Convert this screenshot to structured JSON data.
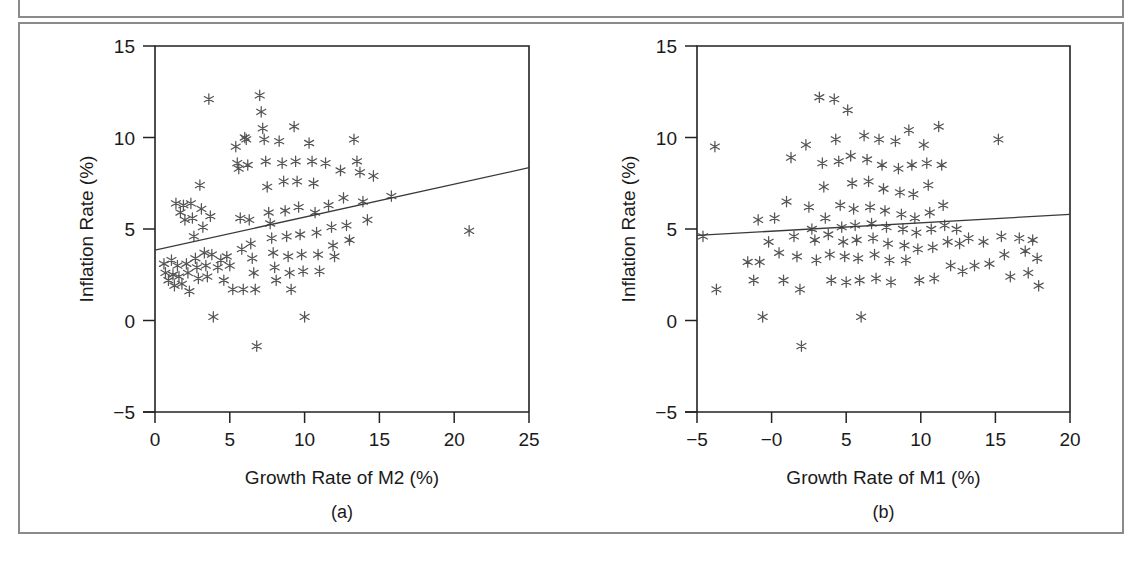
{
  "figure": {
    "border_color": "#8a8a8a",
    "background": "#ffffff",
    "marker_symbol": "asterisk",
    "marker_color": "#555555",
    "axis_color": "#222222",
    "fit_line_color": "#3a3a3a"
  },
  "chart_data": [
    {
      "type": "scatter",
      "panel": "a",
      "caption": "(a)",
      "title": "",
      "xlabel": "Growth Rate of M2 (%)",
      "ylabel": "Inflation Rate (%)",
      "xlim": [
        0,
        25
      ],
      "ylim": [
        -5,
        15
      ],
      "xticks": [
        0,
        5,
        10,
        15,
        20,
        25
      ],
      "xticklabels": [
        "0",
        "5",
        "10",
        "15",
        "20",
        "25"
      ],
      "yticks": [
        -5,
        0,
        5,
        10,
        15
      ],
      "yticklabels": [
        "-5",
        "0",
        "5",
        "10",
        "15"
      ],
      "grid": false,
      "legend": "none",
      "series": [
        {
          "name": "Countries",
          "marker": "asterisk",
          "points": [
            [
              0.6,
              3.1
            ],
            [
              0.7,
              2.6
            ],
            [
              0.9,
              2.2
            ],
            [
              1.1,
              3.3
            ],
            [
              1.2,
              2.5
            ],
            [
              1.3,
              1.9
            ],
            [
              1.4,
              6.4
            ],
            [
              1.5,
              3.0
            ],
            [
              1.6,
              2.4
            ],
            [
              1.7,
              5.9
            ],
            [
              1.8,
              2.0
            ],
            [
              1.9,
              6.3
            ],
            [
              2.0,
              5.5
            ],
            [
              2.1,
              3.1
            ],
            [
              2.2,
              2.6
            ],
            [
              2.3,
              1.6
            ],
            [
              2.4,
              6.4
            ],
            [
              2.5,
              5.6
            ],
            [
              2.6,
              4.6
            ],
            [
              2.7,
              3.4
            ],
            [
              2.8,
              2.9
            ],
            [
              2.9,
              2.3
            ],
            [
              3.0,
              7.4
            ],
            [
              3.1,
              6.1
            ],
            [
              3.2,
              5.1
            ],
            [
              3.3,
              3.7
            ],
            [
              3.4,
              3.0
            ],
            [
              3.5,
              2.4
            ],
            [
              3.6,
              12.1
            ],
            [
              3.7,
              5.7
            ],
            [
              3.8,
              3.6
            ],
            [
              3.9,
              0.2
            ],
            [
              4.2,
              2.9
            ],
            [
              4.4,
              3.3
            ],
            [
              4.6,
              2.2
            ],
            [
              4.8,
              3.5
            ],
            [
              5.0,
              3.0
            ],
            [
              5.2,
              1.7
            ],
            [
              5.4,
              9.5
            ],
            [
              5.5,
              8.6
            ],
            [
              5.6,
              8.3
            ],
            [
              5.7,
              5.6
            ],
            [
              5.8,
              3.9
            ],
            [
              5.9,
              1.7
            ],
            [
              6.0,
              10.0
            ],
            [
              6.1,
              9.9
            ],
            [
              6.2,
              8.5
            ],
            [
              6.3,
              5.5
            ],
            [
              6.4,
              4.2
            ],
            [
              6.5,
              3.4
            ],
            [
              6.6,
              2.6
            ],
            [
              6.7,
              1.7
            ],
            [
              6.8,
              -1.4
            ],
            [
              7.0,
              12.3
            ],
            [
              7.1,
              11.4
            ],
            [
              7.2,
              10.5
            ],
            [
              7.3,
              9.9
            ],
            [
              7.4,
              8.7
            ],
            [
              7.5,
              7.3
            ],
            [
              7.6,
              5.9
            ],
            [
              7.7,
              5.3
            ],
            [
              7.8,
              4.5
            ],
            [
              7.9,
              3.7
            ],
            [
              8.0,
              2.9
            ],
            [
              8.1,
              2.2
            ],
            [
              8.3,
              9.8
            ],
            [
              8.5,
              8.6
            ],
            [
              8.6,
              7.6
            ],
            [
              8.7,
              6.0
            ],
            [
              8.8,
              4.6
            ],
            [
              8.9,
              3.5
            ],
            [
              9.0,
              2.6
            ],
            [
              9.1,
              1.7
            ],
            [
              9.3,
              10.6
            ],
            [
              9.4,
              8.7
            ],
            [
              9.5,
              7.6
            ],
            [
              9.6,
              6.2
            ],
            [
              9.7,
              4.7
            ],
            [
              9.8,
              3.6
            ],
            [
              9.9,
              2.7
            ],
            [
              10.0,
              0.2
            ],
            [
              10.3,
              9.7
            ],
            [
              10.5,
              8.7
            ],
            [
              10.6,
              7.5
            ],
            [
              10.7,
              5.9
            ],
            [
              10.8,
              4.8
            ],
            [
              10.9,
              3.6
            ],
            [
              11.0,
              2.7
            ],
            [
              11.4,
              8.6
            ],
            [
              11.6,
              6.3
            ],
            [
              11.8,
              5.1
            ],
            [
              11.9,
              4.1
            ],
            [
              12.0,
              3.5
            ],
            [
              12.4,
              8.2
            ],
            [
              12.6,
              6.7
            ],
            [
              12.8,
              5.2
            ],
            [
              13.0,
              4.4
            ],
            [
              13.3,
              9.9
            ],
            [
              13.5,
              8.7
            ],
            [
              13.7,
              8.1
            ],
            [
              13.9,
              6.5
            ],
            [
              14.2,
              5.5
            ],
            [
              14.6,
              7.9
            ],
            [
              15.8,
              6.8
            ],
            [
              21.0,
              4.9
            ]
          ]
        }
      ],
      "fit_line": {
        "x": [
          0.0,
          25.0
        ],
        "y": [
          3.85,
          8.35
        ]
      }
    },
    {
      "type": "scatter",
      "panel": "b",
      "caption": "(b)",
      "title": "",
      "xlabel": "Growth Rate of M1 (%)",
      "ylabel": "Inflation Rate (%)",
      "xlim": [
        -5,
        20
      ],
      "ylim": [
        -5,
        15
      ],
      "xticks": [
        -5,
        0,
        5,
        10,
        15,
        20
      ],
      "xticklabels": [
        "-5",
        "-0",
        "5",
        "10",
        "15",
        "20"
      ],
      "yticks": [
        -5,
        0,
        5,
        10,
        15
      ],
      "yticklabels": [
        "-5",
        "0",
        "5",
        "10",
        "15"
      ],
      "grid": false,
      "legend": "none",
      "series": [
        {
          "name": "Countries",
          "marker": "asterisk",
          "points": [
            [
              -4.6,
              4.6
            ],
            [
              -3.8,
              9.5
            ],
            [
              -3.7,
              1.7
            ],
            [
              -1.6,
              3.2
            ],
            [
              -1.2,
              2.2
            ],
            [
              -0.9,
              5.5
            ],
            [
              -0.8,
              3.2
            ],
            [
              -0.6,
              0.2
            ],
            [
              -0.2,
              4.3
            ],
            [
              0.2,
              5.6
            ],
            [
              0.5,
              3.7
            ],
            [
              0.8,
              2.2
            ],
            [
              1.0,
              6.5
            ],
            [
              1.3,
              8.9
            ],
            [
              1.5,
              4.6
            ],
            [
              1.7,
              3.5
            ],
            [
              1.9,
              1.7
            ],
            [
              2.0,
              -1.4
            ],
            [
              2.3,
              9.6
            ],
            [
              2.5,
              6.2
            ],
            [
              2.7,
              5.0
            ],
            [
              2.9,
              4.4
            ],
            [
              3.0,
              3.3
            ],
            [
              3.2,
              12.2
            ],
            [
              3.4,
              8.6
            ],
            [
              3.5,
              7.3
            ],
            [
              3.6,
              5.6
            ],
            [
              3.8,
              4.7
            ],
            [
              3.9,
              3.6
            ],
            [
              4.0,
              2.2
            ],
            [
              4.2,
              12.1
            ],
            [
              4.3,
              9.9
            ],
            [
              4.5,
              8.7
            ],
            [
              4.6,
              6.3
            ],
            [
              4.7,
              5.1
            ],
            [
              4.8,
              4.3
            ],
            [
              4.9,
              3.5
            ],
            [
              5.0,
              2.1
            ],
            [
              5.1,
              11.5
            ],
            [
              5.3,
              9.0
            ],
            [
              5.4,
              7.5
            ],
            [
              5.5,
              6.1
            ],
            [
              5.6,
              5.2
            ],
            [
              5.7,
              4.4
            ],
            [
              5.8,
              3.4
            ],
            [
              5.9,
              2.2
            ],
            [
              6.0,
              0.2
            ],
            [
              6.2,
              10.1
            ],
            [
              6.4,
              8.8
            ],
            [
              6.5,
              7.6
            ],
            [
              6.6,
              6.2
            ],
            [
              6.7,
              5.3
            ],
            [
              6.8,
              4.5
            ],
            [
              6.9,
              3.6
            ],
            [
              7.0,
              2.3
            ],
            [
              7.2,
              9.9
            ],
            [
              7.4,
              8.5
            ],
            [
              7.5,
              7.2
            ],
            [
              7.6,
              6.0
            ],
            [
              7.7,
              5.1
            ],
            [
              7.8,
              4.2
            ],
            [
              7.9,
              3.3
            ],
            [
              8.0,
              2.1
            ],
            [
              8.3,
              9.8
            ],
            [
              8.5,
              8.3
            ],
            [
              8.6,
              7.0
            ],
            [
              8.7,
              5.8
            ],
            [
              8.8,
              5.0
            ],
            [
              8.9,
              4.1
            ],
            [
              9.0,
              3.3
            ],
            [
              9.2,
              10.4
            ],
            [
              9.4,
              8.5
            ],
            [
              9.5,
              6.9
            ],
            [
              9.6,
              5.6
            ],
            [
              9.7,
              4.8
            ],
            [
              9.8,
              3.9
            ],
            [
              9.9,
              2.2
            ],
            [
              10.2,
              9.6
            ],
            [
              10.4,
              8.6
            ],
            [
              10.5,
              7.4
            ],
            [
              10.6,
              5.9
            ],
            [
              10.7,
              5.0
            ],
            [
              10.8,
              4.0
            ],
            [
              10.9,
              2.3
            ],
            [
              11.2,
              10.6
            ],
            [
              11.4,
              8.5
            ],
            [
              11.5,
              6.3
            ],
            [
              11.6,
              5.2
            ],
            [
              11.8,
              4.3
            ],
            [
              12.0,
              3.0
            ],
            [
              12.4,
              5.0
            ],
            [
              12.6,
              4.2
            ],
            [
              12.8,
              2.7
            ],
            [
              13.2,
              4.5
            ],
            [
              13.6,
              3.0
            ],
            [
              14.2,
              4.3
            ],
            [
              14.6,
              3.1
            ],
            [
              15.2,
              9.9
            ],
            [
              15.4,
              4.6
            ],
            [
              15.6,
              3.6
            ],
            [
              16.0,
              2.4
            ],
            [
              16.6,
              4.5
            ],
            [
              17.0,
              3.8
            ],
            [
              17.2,
              2.6
            ],
            [
              17.5,
              4.4
            ],
            [
              17.8,
              3.4
            ],
            [
              17.9,
              1.9
            ]
          ]
        }
      ],
      "fit_line": {
        "x": [
          -5.0,
          20.0
        ],
        "y": [
          4.65,
          5.8
        ]
      }
    }
  ]
}
